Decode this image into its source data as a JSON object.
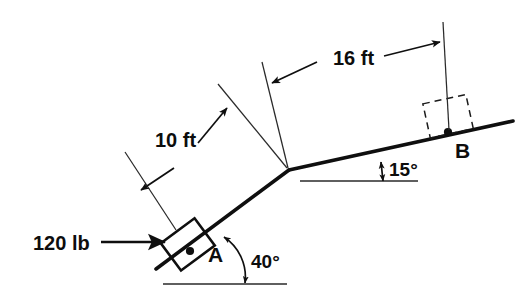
{
  "figure": {
    "kind": "statics-free-body-diagram",
    "background_color": "#ffffff",
    "line_color": "#0f0f0f",
    "labels": {
      "force": "120 lb",
      "dim_lower": "10 ft",
      "dim_upper": "16 ft",
      "point_a": "A",
      "point_b": "B",
      "angle_lower": "40°",
      "angle_upper": "15°"
    },
    "geometry": {
      "angle_lower_deg": 40,
      "angle_upper_deg": 15,
      "length_lower_ft": 10,
      "length_upper_ft": 16,
      "force_lb": 120,
      "force_direction": "horizontal-right"
    }
  }
}
